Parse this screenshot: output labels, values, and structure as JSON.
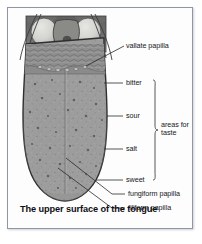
{
  "figure": {
    "caption": "The upper surface of the tongue",
    "border_color": "#8e97a8",
    "background_color": "#fdfdfd"
  },
  "diagram": {
    "title_subject": "tongue",
    "tongue_surface_color": "#9a9a9a",
    "throat_background_color": "#6f6f6f",
    "tonsil_color": "#d8d8d4",
    "outline_color": "#3a3a3a",
    "leader_line_color": "#2b2b2b"
  },
  "labels": [
    {
      "id": "vallate-papilla",
      "text": "vallate papilla"
    },
    {
      "id": "bitter",
      "text": "bitter"
    },
    {
      "id": "sour",
      "text": "sour"
    },
    {
      "id": "salt",
      "text": "salt"
    },
    {
      "id": "sweet",
      "text": "sweet"
    },
    {
      "id": "areas-for-taste-line1",
      "text": "areas for"
    },
    {
      "id": "areas-for-taste-line2",
      "text": "taste"
    },
    {
      "id": "fungiform-papilla",
      "text": "fungiform papilla"
    },
    {
      "id": "filiform-papilla",
      "text": "filiform papilla"
    }
  ]
}
